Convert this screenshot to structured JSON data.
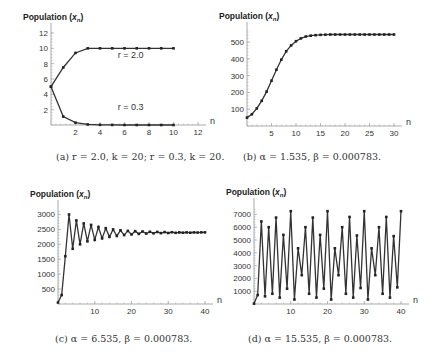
{
  "figure": {
    "captions": [
      "(a) r = 2.0, k = 20;  r = 0.3, k = 20.",
      "(b) α = 1.535,  β = 0.000783.",
      "(c) α = 6.535,  β = 0.000783.",
      "(d) α = 15.535,  β = 0.000783."
    ],
    "colors": {
      "line": "#333333",
      "marker": "#222222",
      "axis": "#aaaaaa",
      "text": "#333333"
    }
  },
  "chart_data": [
    {
      "id": "a",
      "type": "line",
      "title": "",
      "ylabel": "Population (x_n)",
      "xlabel": "n",
      "caption": "(a) r = 2.0, k = 20;  r = 0.3, k = 20.",
      "xlim": [
        0,
        12
      ],
      "ylim": [
        0,
        12
      ],
      "xticks": [
        2,
        4,
        6,
        8,
        10,
        12
      ],
      "yticks": [
        2,
        4,
        6,
        8,
        10,
        12
      ],
      "grid": false,
      "x": [
        0,
        1,
        2,
        3,
        4,
        5,
        6,
        7,
        8,
        9,
        10
      ],
      "series": [
        {
          "name": "r = 2.0",
          "values": [
            5,
            7.5,
            9.4,
            10,
            10,
            10,
            10,
            10,
            10,
            10,
            10
          ],
          "label_pos": [
            6.5,
            8.7
          ]
        },
        {
          "name": "r = 0.3",
          "values": [
            5,
            1.1,
            0.3,
            0.07,
            0.02,
            0.01,
            0,
            0,
            0,
            0,
            0
          ],
          "label_pos": [
            6.5,
            1.9
          ]
        }
      ],
      "frame": {
        "x0": 51,
        "y0": 125,
        "x1": 198,
        "y1": 33
      }
    },
    {
      "id": "b",
      "type": "line",
      "title": "",
      "ylabel": "Population (x_n)",
      "xlabel": "n",
      "caption": "(b) α = 1.535,  β = 0.000783.",
      "xlim": [
        0,
        30
      ],
      "ylim": [
        0,
        560
      ],
      "xticks": [
        5,
        10,
        15,
        20,
        25,
        30
      ],
      "yticks": [
        100,
        200,
        300,
        400,
        500
      ],
      "grid": false,
      "x": [
        0,
        1,
        2,
        3,
        4,
        5,
        6,
        7,
        8,
        9,
        10,
        11,
        12,
        13,
        14,
        15,
        16,
        17,
        18,
        19,
        20,
        21,
        22,
        23,
        24,
        25,
        26,
        27,
        28,
        29,
        30
      ],
      "series": [
        {
          "name": "x_n",
          "values": [
            50,
            70,
            105,
            150,
            205,
            270,
            335,
            395,
            445,
            480,
            505,
            522,
            533,
            538,
            541,
            543,
            544,
            545,
            545,
            545,
            545,
            545,
            545,
            545,
            545,
            545,
            545,
            545,
            545,
            545,
            545
          ]
        }
      ],
      "frame": {
        "x0": 247,
        "y0": 126,
        "x1": 394,
        "y1": 32
      }
    },
    {
      "id": "c",
      "type": "line",
      "title": "",
      "ylabel": "Population (x_n)",
      "xlabel": "n",
      "caption": "(c) α = 6.535,  β = 0.000783.",
      "xlim": [
        0,
        40
      ],
      "ylim": [
        0,
        3150
      ],
      "xticks": [
        10,
        20,
        30,
        40
      ],
      "yticks": [
        500,
        1000,
        1500,
        2000,
        2500,
        3000
      ],
      "grid": false,
      "x": [
        0,
        1,
        2,
        3,
        4,
        5,
        6,
        7,
        8,
        9,
        10,
        11,
        12,
        13,
        14,
        15,
        16,
        17,
        18,
        19,
        20,
        21,
        22,
        23,
        24,
        25,
        26,
        27,
        28,
        29,
        30,
        31,
        32,
        33,
        34,
        35,
        36,
        37,
        38,
        39,
        40
      ],
      "series": [
        {
          "name": "x_n",
          "values": [
            50,
            300,
            1600,
            3000,
            1850,
            2800,
            2000,
            2700,
            2100,
            2650,
            2150,
            2580,
            2200,
            2540,
            2250,
            2500,
            2280,
            2470,
            2310,
            2450,
            2330,
            2440,
            2350,
            2430,
            2360,
            2420,
            2370,
            2415,
            2375,
            2410,
            2380,
            2405,
            2385,
            2400,
            2390,
            2400,
            2390,
            2400,
            2395,
            2400,
            2400
          ]
        }
      ],
      "frame": {
        "x0": 58,
        "y0": 304,
        "x1": 205,
        "y1": 210
      }
    },
    {
      "id": "d",
      "type": "line",
      "title": "",
      "ylabel": "Population (x_n)",
      "xlabel": "n",
      "caption": "(d) α = 15.535,  β = 0.000783.",
      "xlim": [
        0,
        40
      ],
      "ylim": [
        0,
        7500
      ],
      "xticks": [
        10,
        20,
        30,
        40
      ],
      "yticks": [
        1000,
        2000,
        3000,
        4000,
        5000,
        6000,
        7000
      ],
      "grid": false,
      "x": [
        0,
        1,
        2,
        3,
        4,
        5,
        6,
        7,
        8,
        9,
        10,
        11,
        12,
        13,
        14,
        15,
        16,
        17,
        18,
        19,
        20,
        21,
        22,
        23,
        24,
        25,
        26,
        27,
        28,
        29,
        30,
        31,
        32,
        33,
        34,
        35,
        36,
        37,
        38,
        39,
        40
      ],
      "series": [
        {
          "name": "x_n",
          "values": [
            30,
            700,
            6450,
            600,
            6000,
            800,
            6750,
            500,
            5400,
            1200,
            7250,
            350,
            4350,
            2250,
            6000,
            800,
            6750,
            500,
            5400,
            1200,
            7250,
            350,
            4350,
            2250,
            6000,
            800,
            6800,
            500,
            5350,
            1250,
            7250,
            350,
            4350,
            2250,
            6000,
            800,
            6800,
            500,
            5300,
            1300,
            7250
          ]
        }
      ],
      "frame": {
        "x0": 254,
        "y0": 304,
        "x1": 401,
        "y1": 208
      }
    }
  ]
}
